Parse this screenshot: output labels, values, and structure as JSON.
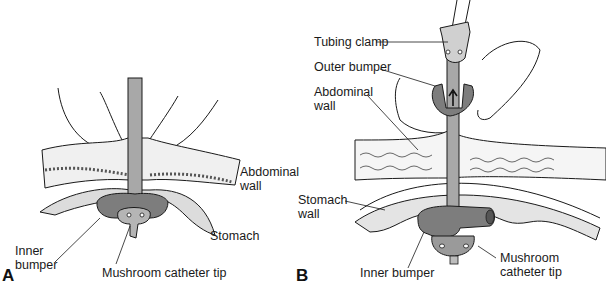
{
  "figure": {
    "panels": [
      {
        "letter": "A",
        "labels": {
          "abdominal_wall_1": "Abdominal",
          "abdominal_wall_2": "wall",
          "stomach": "Stomach",
          "inner_bumper_1": "Inner",
          "inner_bumper_2": "bumper",
          "mushroom_tip": "Mushroom catheter tip"
        }
      },
      {
        "letter": "B",
        "labels": {
          "tubing_clamp": "Tubing clamp",
          "outer_bumper": "Outer bumper",
          "abdominal_wall_1": "Abdominal",
          "abdominal_wall_2": "wall",
          "stomach_wall_1": "Stomach",
          "stomach_wall_2": "wall",
          "inner_bumper": "Inner bumper",
          "mushroom_tip_1": "Mushroom",
          "mushroom_tip_2": "catheter tip"
        }
      }
    ],
    "colors": {
      "line": "#1a1a1a",
      "tissue_fill": "#f2f2f2",
      "bumper_fill": "#7d7d7d",
      "tube_fill": "#a8a8a8",
      "stomach_fill": "#e4e4e4"
    }
  }
}
